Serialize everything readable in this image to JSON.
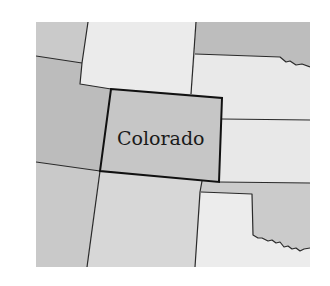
{
  "map": {
    "highlighted_state": "Colorado",
    "labels": {
      "colorado": "Colorado"
    },
    "colors": {
      "dark_gray": "#b9b9b9",
      "mid_gray": "#c9c9c9",
      "light_gray": "#d6d6d6",
      "pale": "#e9e9e9",
      "highlight": "#c6c6c6",
      "border": "#1e1e1e"
    },
    "regions": [
      {
        "id": "idaho",
        "shade": "mid_gray"
      },
      {
        "id": "wyoming",
        "shade": "pale"
      },
      {
        "id": "south-dakota",
        "shade": "dark_gray"
      },
      {
        "id": "nebraska",
        "shade": "pale"
      },
      {
        "id": "utah",
        "shade": "dark_gray"
      },
      {
        "id": "colorado",
        "shade": "highlight"
      },
      {
        "id": "kansas",
        "shade": "pale"
      },
      {
        "id": "arizona",
        "shade": "mid_gray"
      },
      {
        "id": "new-mexico",
        "shade": "light_gray"
      },
      {
        "id": "oklahoma",
        "shade": "mid_gray"
      },
      {
        "id": "texas",
        "shade": "pale"
      }
    ]
  }
}
